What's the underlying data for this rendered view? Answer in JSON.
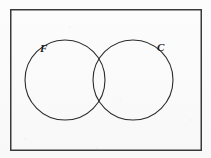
{
  "figure": {
    "type": "venn-diagram",
    "width": 211,
    "height": 158,
    "background_color": "#fdfdfd",
    "stroke_color": "#2b2b2b",
    "universe_label": "",
    "sets": [
      {
        "id": "F",
        "label": "F",
        "cx": 65,
        "cy": 80,
        "r": 40,
        "label_x": 44,
        "label_y": 52
      },
      {
        "id": "C",
        "label": "C",
        "cx": 133,
        "cy": 80,
        "r": 40,
        "label_x": 158,
        "label_y": 51
      }
    ],
    "frame": {
      "x": 10,
      "y": 9,
      "width": 191,
      "height": 141,
      "stroke_color": "#3a3a3a",
      "stroke_width": 1.5
    }
  }
}
